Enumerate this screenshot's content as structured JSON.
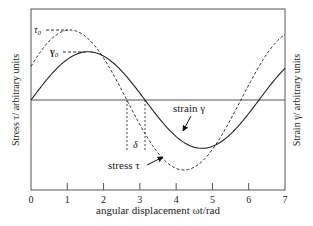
{
  "chart_data": {
    "type": "line",
    "title": "",
    "xlabel": "angular displacement ωt/rad",
    "ylabel_left": "Stress τ/ arbitrary units",
    "ylabel_right": "Strain γ/ arbitrary units",
    "xlim": [
      0,
      7
    ],
    "ylim": [
      -1.3,
      1.3
    ],
    "xticks": [
      0,
      1,
      2,
      3,
      4,
      5,
      6,
      7
    ],
    "xtick_labels": [
      "0",
      "1",
      "2",
      "3",
      "4",
      "5",
      "6",
      "7"
    ],
    "grid": false,
    "legend": "none (inline annotations)",
    "series": [
      {
        "name": "stress τ",
        "style": "dashed",
        "function": "τ0·sin(ωt + δ)",
        "amplitude": 1.0,
        "phase_shift_rad": 0.5,
        "x": [
          0,
          0.5,
          1.0,
          1.5,
          2.0,
          2.5,
          3.0,
          3.5,
          4.0,
          4.5,
          5.0,
          5.5,
          6.0,
          6.5,
          7.0
        ],
        "values": [
          0.48,
          0.84,
          1.0,
          0.91,
          0.6,
          0.14,
          -0.35,
          -0.76,
          -0.98,
          -0.94,
          -0.71,
          -0.28,
          0.22,
          0.66,
          0.94
        ]
      },
      {
        "name": "strain γ",
        "style": "solid",
        "function": "γ0·sin(ωt)",
        "amplitude": 0.69,
        "phase_shift_rad": 0,
        "x": [
          0,
          0.5,
          1.0,
          1.5,
          2.0,
          2.5,
          3.0,
          3.5,
          4.0,
          4.5,
          5.0,
          5.5,
          6.0,
          6.5,
          7.0
        ],
        "values": [
          0.0,
          0.33,
          0.58,
          0.69,
          0.63,
          0.41,
          0.1,
          -0.24,
          -0.52,
          -0.67,
          -0.66,
          -0.49,
          -0.19,
          0.15,
          0.45
        ]
      }
    ],
    "annotations": [
      {
        "text": "τ0",
        "meaning": "stress amplitude marker at peak of stress curve"
      },
      {
        "text": "γ0",
        "meaning": "strain amplitude marker at peak of strain curve"
      },
      {
        "text": "δ",
        "meaning": "phase lag between zero crossings of stress and strain (~0.5 rad)"
      },
      {
        "text": "strain γ",
        "meaning": "label with arrow pointing to solid curve"
      },
      {
        "text": "stress τ",
        "meaning": "label with arrow pointing to dashed curve"
      }
    ]
  },
  "labels": {
    "xlabel": "angular displacement ωt/rad",
    "ylabel_left": "Stress τ/ arbitrary units",
    "ylabel_right": "Strain γ/ arbitrary units",
    "tau0": "τ",
    "tau0_sub": "0",
    "gamma0": "γ",
    "gamma0_sub": "0",
    "delta": "δ",
    "strain_label": "strain γ",
    "stress_label": "stress τ",
    "ticks": [
      "0",
      "1",
      "2",
      "3",
      "4",
      "5",
      "6",
      "7"
    ]
  },
  "colors": {
    "axis": "#555555",
    "curve": "#222222",
    "background": "#ffffff"
  }
}
